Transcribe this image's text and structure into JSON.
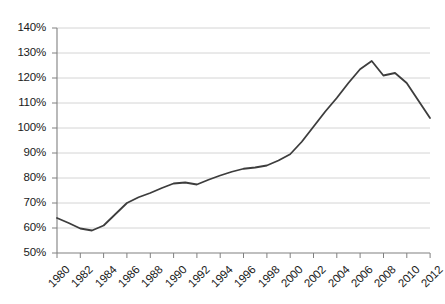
{
  "chart_data": {
    "type": "line",
    "title": "",
    "subtitle": "",
    "xlabel": "",
    "ylabel": "",
    "grid": true,
    "legend": null,
    "legend_position": "none",
    "xlim": [
      1980,
      2012
    ],
    "ylim": [
      50,
      140
    ],
    "y_tick_step": 10,
    "x_tick_step": 2,
    "y_tick_labels": [
      "140%",
      "130%",
      "120%",
      "110%",
      "100%",
      "90%",
      "80%",
      "70%",
      "60%",
      "50%"
    ],
    "y_tick_values": [
      140,
      130,
      120,
      110,
      100,
      90,
      80,
      70,
      60,
      50
    ],
    "x_tick_labels": [
      "1980",
      "1982",
      "1984",
      "1986",
      "1988",
      "1990",
      "1992",
      "1994",
      "1996",
      "1998",
      "2000",
      "2002",
      "2004",
      "2006",
      "2008",
      "2010",
      "2012"
    ],
    "x_tick_values": [
      1980,
      1982,
      1984,
      1986,
      1988,
      1990,
      1992,
      1994,
      1996,
      1998,
      2000,
      2002,
      2004,
      2006,
      2008,
      2010,
      2012
    ],
    "series": [
      {
        "name": "series-1",
        "color": "#3d3d3d",
        "line_width": 1.8,
        "x": [
          1980,
          1981,
          1982,
          1983,
          1984,
          1985,
          1986,
          1987,
          1988,
          1989,
          1990,
          1991,
          1992,
          1993,
          1994,
          1995,
          1996,
          1997,
          1998,
          1999,
          2000,
          2001,
          2002,
          2003,
          2004,
          2005,
          2006,
          2007,
          2008,
          2009,
          2010,
          2011,
          2012
        ],
        "values": [
          64.0,
          62.0,
          59.8,
          59.0,
          61.0,
          65.5,
          70.0,
          72.3,
          74.0,
          76.0,
          77.8,
          78.2,
          77.4,
          79.3,
          81.0,
          82.5,
          83.7,
          84.2,
          85.0,
          87.0,
          89.5,
          94.5,
          100.5,
          106.5,
          112.0,
          118.0,
          123.5,
          126.8,
          121.0,
          122.0,
          118.0,
          111.0,
          104.0
        ]
      }
    ]
  }
}
